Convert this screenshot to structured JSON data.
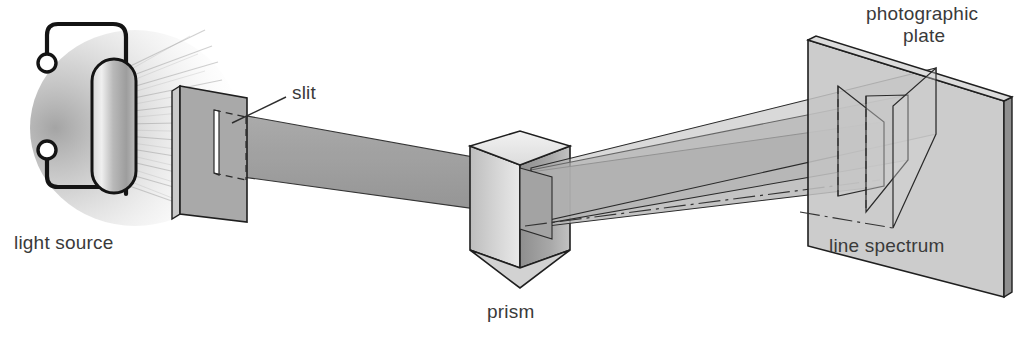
{
  "figure": {
    "background_color": "#ffffff",
    "label_color": "#3a3a3a",
    "outline_color": "#1c1c1c"
  },
  "labels": {
    "light_source": "light source",
    "slit": "slit",
    "prism": "prism",
    "photographic_plate_line1": "photographic",
    "photographic_plate_line2": "plate",
    "line_spectrum": "line spectrum"
  },
  "components": {
    "light_source": {
      "name": "light source",
      "shape": "discharge tube capsule",
      "fill": "#b5b5b5",
      "outline": "#141414",
      "glow": "radiating rays to the right",
      "terminals": 2,
      "terminal_fill": "#ffffff"
    },
    "slit_plate": {
      "name": "slit plate",
      "shape": "rectangular plate in perspective",
      "fill": "#a9a9a9",
      "edge_fill": "#c9c9c9",
      "slit_fill": "#ffffff"
    },
    "prism": {
      "name": "prism",
      "shape": "triangular prism",
      "top_face_fill": "#e6e6e6",
      "left_face_fill": "#c3c3c3",
      "right_face_fill": "#9a9a9a"
    },
    "photographic_plate": {
      "name": "photographic plate",
      "shape": "rectangular plate in perspective",
      "fill": "#c4c4c4",
      "edge_fill": "#8f8f8f"
    },
    "incident_beam": {
      "name": "incident beam",
      "fill": "#9d9d9d",
      "description": "collimated beam from slit to prism"
    },
    "dispersed_beams": {
      "count": 3,
      "fill": "#b0b0b0",
      "description": "three refracted beams fanning from prism to plate"
    },
    "spectral_lines": {
      "count": 3,
      "description": "three bright rectangles forming the line spectrum on the plate"
    }
  }
}
